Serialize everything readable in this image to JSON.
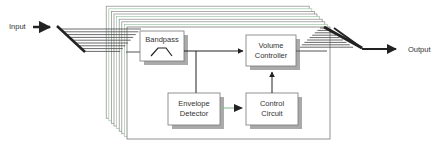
{
  "labels": {
    "input": "Input",
    "output": "Output"
  },
  "blocks": {
    "bandpass": {
      "label": "Bandpass"
    },
    "volume_controller": {
      "line1": "Volume",
      "line2": "Controller"
    },
    "envelope_detector": {
      "line1": "Envelope",
      "line2": "Detector"
    },
    "control_circuit": {
      "line1": "Control",
      "line2": "Circuit"
    }
  },
  "colors": {
    "line": "#222222",
    "frame": "#888888",
    "shadow": "#aaaaaa",
    "accent": "#7fb88a"
  },
  "stack_count": 9
}
